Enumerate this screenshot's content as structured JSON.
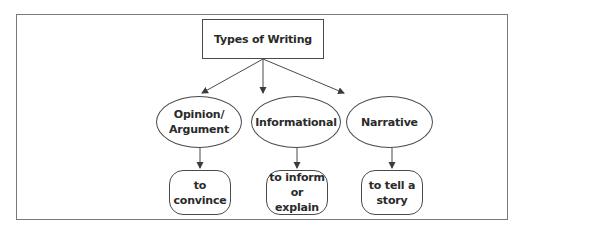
{
  "diagram": {
    "title": "Types of Writing",
    "categories": [
      {
        "name": "Opinion/\nArgument",
        "purpose": "to\nconvince"
      },
      {
        "name": "Informational",
        "purpose": "to inform\nor explain"
      },
      {
        "name": "Narrative",
        "purpose": "to tell a\nstory"
      }
    ],
    "colors": {
      "frame": "#7a7a7a",
      "stroke": "#4a4a4a",
      "text": "#2a2a2a",
      "background": "#ffffff"
    }
  }
}
